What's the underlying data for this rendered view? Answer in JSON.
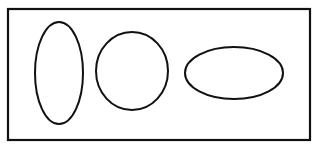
{
  "figure": {
    "caption_remnant": "― 分片分布",
    "caption_note": "clipped text line at top edge, largely cut off and illegible",
    "background_color": "#ffffff",
    "stroke_color": "#111111",
    "frame": {
      "name": "bounding-rectangle",
      "x": 8,
      "y": 9,
      "width": 302,
      "height": 131,
      "stroke_width": 2.2
    },
    "shapes": [
      {
        "name": "ellipse-tall-narrow",
        "label": "tall narrow ellipse",
        "cx": 59,
        "cy": 73,
        "rx": 24,
        "ry": 51,
        "stroke_width": 2.0,
        "orientation": "vertical"
      },
      {
        "name": "ellipse-round",
        "label": "near-circular ellipse",
        "cx": 132,
        "cy": 71,
        "rx": 36,
        "ry": 39,
        "stroke_width": 2.0,
        "orientation": "round"
      },
      {
        "name": "ellipse-wide-flat",
        "label": "wide flat ellipse",
        "cx": 234,
        "cy": 73,
        "rx": 49,
        "ry": 26,
        "stroke_width": 2.0,
        "orientation": "horizontal"
      }
    ]
  }
}
